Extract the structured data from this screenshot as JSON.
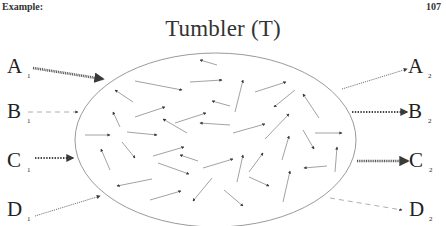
{
  "header": {
    "left": "Example:",
    "page_number": "107"
  },
  "title": "Tumbler (T)",
  "colors": {
    "ellipse": "#9a9a9a",
    "arrow": "#8a8a8a",
    "arrowhead": "#3a3a3a",
    "text": "#222222"
  },
  "tumbler": {
    "cx": 215.5,
    "cy": 140,
    "rx": 140.5,
    "ry": 87
  },
  "inputs": [
    {
      "letter": "A",
      "sub": "1",
      "x": 7,
      "y": 73,
      "arrow": {
        "from": [
          33,
          68
        ],
        "to": [
          103,
          79
        ],
        "style": "hatched"
      }
    },
    {
      "letter": "B",
      "sub": "1",
      "x": 7,
      "y": 118,
      "arrow": {
        "from": [
          28,
          112
        ],
        "to": [
          78,
          112
        ],
        "style": "dashed"
      }
    },
    {
      "letter": "C",
      "sub": "1",
      "x": 7,
      "y": 167,
      "arrow": {
        "from": [
          35,
          158
        ],
        "to": [
          73,
          158
        ],
        "style": "heavy-dotted"
      }
    },
    {
      "letter": "D",
      "sub": "1",
      "x": 7,
      "y": 216,
      "arrow": {
        "from": [
          35,
          216
        ],
        "to": [
          100,
          196
        ],
        "style": "fine-dotted"
      }
    }
  ],
  "outputs": [
    {
      "letter": "A",
      "sub": "2",
      "x": 408,
      "y": 73,
      "arrow": {
        "from": [
          342,
          89
        ],
        "to": [
          407,
          69
        ],
        "style": "fine-dotted"
      }
    },
    {
      "letter": "B",
      "sub": "2",
      "x": 408,
      "y": 118,
      "arrow": {
        "from": [
          352,
          112
        ],
        "to": [
          407,
          112
        ],
        "style": "heavy-dotted"
      }
    },
    {
      "letter": "C",
      "sub": "2",
      "x": 409,
      "y": 167,
      "arrow": {
        "from": [
          357,
          161
        ],
        "to": [
          408,
          161
        ],
        "style": "hatched"
      }
    },
    {
      "letter": "D",
      "sub": "2",
      "x": 409,
      "y": 216,
      "arrow": {
        "from": [
          330,
          198
        ],
        "to": [
          402,
          210
        ],
        "style": "dashed"
      }
    }
  ],
  "internal_arrows": [
    [
      [
        217,
        65
      ],
      [
        200,
        60
      ]
    ],
    [
      [
        135,
        81
      ],
      [
        182,
        90
      ]
    ],
    [
      [
        190,
        82
      ],
      [
        222,
        80
      ]
    ],
    [
      [
        133,
        102
      ],
      [
        115,
        90
      ]
    ],
    [
      [
        230,
        106
      ],
      [
        212,
        101
      ]
    ],
    [
      [
        120,
        127
      ],
      [
        113,
        112
      ]
    ],
    [
      [
        135,
        117
      ],
      [
        165,
        107
      ]
    ],
    [
      [
        175,
        123
      ],
      [
        206,
        113
      ]
    ],
    [
      [
        187,
        133
      ],
      [
        163,
        119
      ]
    ],
    [
      [
        230,
        125
      ],
      [
        200,
        123
      ]
    ],
    [
      [
        85,
        135
      ],
      [
        110,
        135
      ]
    ],
    [
      [
        127,
        132
      ],
      [
        157,
        135
      ]
    ],
    [
      [
        235,
        112
      ],
      [
        243,
        80
      ]
    ],
    [
      [
        255,
        92
      ],
      [
        286,
        82
      ]
    ],
    [
      [
        295,
        90
      ],
      [
        274,
        107
      ]
    ],
    [
      [
        319,
        118
      ],
      [
        303,
        94
      ]
    ],
    [
      [
        233,
        133
      ],
      [
        265,
        124
      ]
    ],
    [
      [
        265,
        139
      ],
      [
        289,
        114
      ]
    ],
    [
      [
        315,
        133
      ],
      [
        342,
        133
      ]
    ],
    [
      [
        122,
        142
      ],
      [
        135,
        158
      ]
    ],
    [
      [
        110,
        170
      ],
      [
        101,
        149
      ]
    ],
    [
      [
        153,
        156
      ],
      [
        184,
        147
      ]
    ],
    [
      [
        198,
        161
      ],
      [
        180,
        155
      ]
    ],
    [
      [
        158,
        163
      ],
      [
        189,
        174
      ]
    ],
    [
      [
        203,
        168
      ],
      [
        233,
        159
      ]
    ],
    [
      [
        152,
        179
      ],
      [
        117,
        186
      ]
    ],
    [
      [
        150,
        200
      ],
      [
        181,
        191
      ]
    ],
    [
      [
        212,
        178
      ],
      [
        193,
        201
      ]
    ],
    [
      [
        224,
        190
      ],
      [
        243,
        206
      ]
    ],
    [
      [
        237,
        182
      ],
      [
        243,
        155
      ]
    ],
    [
      [
        249,
        172
      ],
      [
        263,
        153
      ]
    ],
    [
      [
        249,
        177
      ],
      [
        269,
        186
      ]
    ],
    [
      [
        282,
        160
      ],
      [
        289,
        136
      ]
    ],
    [
      [
        303,
        130
      ],
      [
        314,
        149
      ]
    ],
    [
      [
        283,
        202
      ],
      [
        290,
        171
      ]
    ],
    [
      [
        327,
        166
      ],
      [
        304,
        168
      ]
    ],
    [
      [
        335,
        172
      ],
      [
        337,
        147
      ]
    ]
  ]
}
